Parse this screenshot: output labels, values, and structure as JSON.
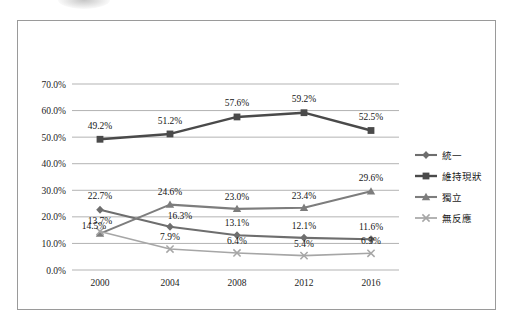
{
  "chart_data": {
    "type": "line",
    "title": "",
    "subtitle": "",
    "xlabel": "",
    "ylabel": "",
    "categories": [
      "2000",
      "2004",
      "2008",
      "2012",
      "2016"
    ],
    "x": [
      2000,
      2004,
      2008,
      2012,
      2016
    ],
    "ylim": [
      0,
      70
    ],
    "ytick_labels": [
      "0.0%",
      "10.0%",
      "20.0%",
      "30.0%",
      "40.0%",
      "50.0%",
      "60.0%",
      "70.0%"
    ],
    "ytick_values": [
      0,
      10,
      20,
      30,
      40,
      50,
      60,
      70
    ],
    "grid": true,
    "legend_position": "right",
    "series": [
      {
        "name": "統一",
        "marker": "diamond",
        "color": "#6e6e6e",
        "values": [
          22.7,
          16.3,
          13.1,
          12.1,
          11.6
        ],
        "labels": [
          "22.7%",
          "16.3%",
          "13.1%",
          "12.1%",
          "11.6%"
        ]
      },
      {
        "name": "維持現狀",
        "marker": "square",
        "color": "#4a4a4a",
        "values": [
          49.2,
          51.2,
          57.6,
          59.2,
          52.5
        ],
        "labels": [
          "49.2%",
          "51.2%",
          "57.6%",
          "59.2%",
          "52.5%"
        ]
      },
      {
        "name": "獨立",
        "marker": "triangle",
        "color": "#7d7d7d",
        "values": [
          13.7,
          24.6,
          23.0,
          23.4,
          29.6
        ],
        "labels": [
          "13.7%",
          "24.6%",
          "23.0%",
          "23.4%",
          "29.6%"
        ]
      },
      {
        "name": "無反應",
        "marker": "cross",
        "color": "#a6a6a6",
        "values": [
          14.5,
          7.9,
          6.4,
          5.4,
          6.3
        ],
        "labels": [
          "14.5%",
          "7.9%",
          "6.4%",
          "5.4%",
          "6.3%"
        ]
      }
    ]
  },
  "legend": {
    "items": [
      {
        "label": "統一"
      },
      {
        "label": "維持現狀"
      },
      {
        "label": "獨立"
      },
      {
        "label": "無反應"
      }
    ]
  },
  "axes": {
    "y_ticks": [
      {
        "label": "70.0%"
      },
      {
        "label": "60.0%"
      },
      {
        "label": "50.0%"
      },
      {
        "label": "40.0%"
      },
      {
        "label": "30.0%"
      },
      {
        "label": "20.0%"
      },
      {
        "label": "10.0%"
      },
      {
        "label": "0.0%"
      }
    ],
    "x_ticks": [
      {
        "label": "2000"
      },
      {
        "label": "2004"
      },
      {
        "label": "2008"
      },
      {
        "label": "2012"
      },
      {
        "label": "2016"
      }
    ]
  },
  "colors": {
    "frame": "#9a9a9a",
    "gridline": "#b3b3b3",
    "background": "#ffffff",
    "text": "#1c1c1c"
  }
}
